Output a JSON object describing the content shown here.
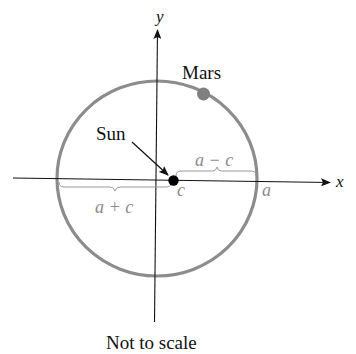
{
  "diagram": {
    "caption": "Not to scale",
    "axes": {
      "x_label": "x",
      "y_label": "y"
    },
    "orbit": {
      "color": "#8c8c8c"
    },
    "bodies": {
      "mars_label": "Mars",
      "mars_color": "#7f7f7f",
      "sun_label": "Sun",
      "sun_color": "#000000"
    },
    "annotations": {
      "a_minus_c": "a − c",
      "a_plus_c": "a + c",
      "focus_label": "c",
      "vertex_label": "a"
    }
  }
}
